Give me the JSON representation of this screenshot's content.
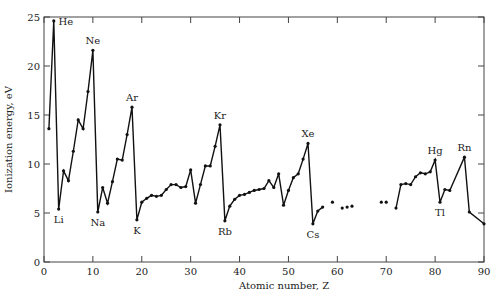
{
  "chart_data": {
    "type": "line",
    "title": "",
    "xlabel": "Atomic number, Z",
    "ylabel": "Ionization energy, eV",
    "xlim": [
      0,
      90
    ],
    "ylim": [
      0,
      25
    ],
    "xticks": [
      0,
      10,
      20,
      30,
      40,
      50,
      60,
      70,
      80,
      90
    ],
    "yticks": [
      0,
      5,
      10,
      15,
      20,
      25
    ],
    "grid": false,
    "legend": null,
    "segments": [
      {
        "x": [
          1,
          2,
          3,
          4,
          5,
          6,
          7,
          8,
          9,
          10,
          11,
          12,
          13,
          14,
          15,
          16,
          17,
          18,
          19,
          20,
          21,
          22,
          23,
          24,
          25,
          26,
          27,
          28,
          29,
          30,
          31,
          32,
          33,
          34,
          35,
          36,
          37,
          38,
          39,
          40,
          41,
          42,
          43,
          44,
          45,
          46,
          47,
          48,
          49,
          50,
          51,
          52,
          53,
          54,
          55,
          56,
          57
        ],
        "y": [
          13.6,
          24.6,
          5.4,
          9.3,
          8.3,
          11.3,
          14.5,
          13.6,
          17.4,
          21.6,
          5.1,
          7.6,
          6.0,
          8.2,
          10.5,
          10.4,
          13.0,
          15.8,
          4.3,
          6.1,
          6.5,
          6.8,
          6.7,
          6.8,
          7.4,
          7.9,
          7.9,
          7.6,
          7.7,
          9.4,
          6.0,
          7.9,
          9.8,
          9.8,
          11.8,
          14.0,
          4.2,
          5.7,
          6.4,
          6.8,
          6.9,
          7.1,
          7.3,
          7.4,
          7.5,
          8.3,
          7.6,
          9.0,
          5.8,
          7.3,
          8.6,
          9.0,
          10.5,
          12.1,
          3.9,
          5.2,
          5.6
        ]
      },
      {
        "x": [
          59,
          61,
          62,
          63,
          69,
          70
        ],
        "y": [
          6.1,
          5.5,
          5.6,
          5.7,
          6.1,
          6.1
        ],
        "points_only": true
      },
      {
        "x": [
          72,
          73,
          74,
          75,
          76,
          77,
          78,
          79,
          80,
          81,
          82,
          83,
          86,
          87,
          90
        ],
        "y": [
          5.5,
          7.9,
          8.0,
          7.9,
          8.7,
          9.1,
          9.0,
          9.2,
          10.4,
          6.1,
          7.4,
          7.3,
          10.7,
          5.1,
          3.9
        ]
      }
    ],
    "annotations": [
      {
        "text": "He",
        "x": 2,
        "y": 24.6
      },
      {
        "text": "Ne",
        "x": 10,
        "y": 21.6
      },
      {
        "text": "Ar",
        "x": 18,
        "y": 15.8
      },
      {
        "text": "Kr",
        "x": 36,
        "y": 14.0
      },
      {
        "text": "Xe",
        "x": 54,
        "y": 12.1
      },
      {
        "text": "Hg",
        "x": 80,
        "y": 10.4
      },
      {
        "text": "Rn",
        "x": 86,
        "y": 10.7
      },
      {
        "text": "Li",
        "x": 3,
        "y": 5.4
      },
      {
        "text": "Na",
        "x": 11,
        "y": 5.1
      },
      {
        "text": "K",
        "x": 19,
        "y": 4.3
      },
      {
        "text": "Rb",
        "x": 37,
        "y": 4.2
      },
      {
        "text": "Cs",
        "x": 55,
        "y": 3.9
      },
      {
        "text": "Tl",
        "x": 81,
        "y": 6.1
      }
    ]
  }
}
